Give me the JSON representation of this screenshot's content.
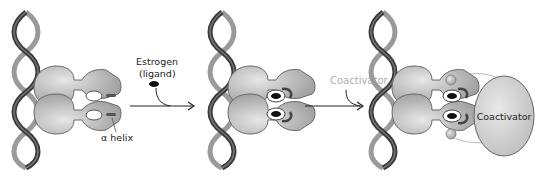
{
  "diagram": {
    "type": "biological-process",
    "stages": [
      {
        "id": "stage-1",
        "description": "Estrogen receptor dimer bound to DNA, ligand pocket empty"
      },
      {
        "id": "stage-2",
        "description": "Estrogen bound in ligand pocket, alpha helix repositioned"
      },
      {
        "id": "stage-3",
        "description": "Coactivator binds the receptor dimer"
      }
    ],
    "labels": {
      "estrogen_line1": "Estrogen",
      "estrogen_line2": "(ligand)",
      "alpha_helix": "α helix",
      "coactivator_arrow": "Coactivator",
      "coactivator_body": "Coactivator"
    },
    "arrows": [
      {
        "from": "stage-1",
        "to": "stage-2",
        "label": "Estrogen (ligand)"
      },
      {
        "from": "stage-2",
        "to": "stage-3",
        "label": "Coactivator"
      }
    ],
    "colors": {
      "dna_dark": "#3a3a3a",
      "dna_light": "#9a9a9a",
      "protein_fill": "#c4c4c4",
      "protein_stroke": "#6a6a6a",
      "ligand": "#111111",
      "coactivator_fill": "#d2d2d2",
      "coactivator_label_gray": "#b0b0b0"
    }
  }
}
